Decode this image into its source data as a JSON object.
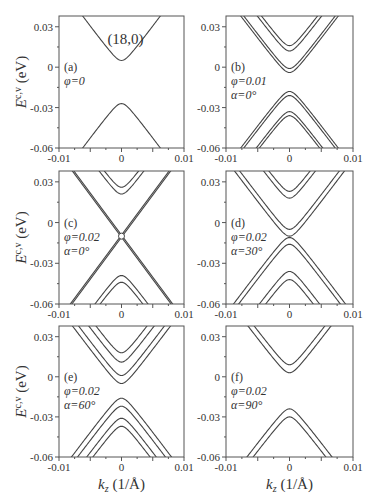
{
  "chart_data": {
    "type": "line",
    "title": "(18,0)",
    "ylabel": "E^{c,v} (eV)",
    "xlabel": "k_z (1/Å)",
    "xlim": [
      -0.01,
      0.01
    ],
    "ylim": [
      -0.06,
      0.038
    ],
    "xticks": [
      "-0.01",
      "0",
      "0.01"
    ],
    "yticks": [
      "0.03",
      "0",
      "-0.03",
      "-0.06"
    ],
    "panels": [
      {
        "id": "a",
        "label": "(a)",
        "phi": "φ=0",
        "alpha": "",
        "title": "(18,0)",
        "conduction_minima": [
          0.005
        ],
        "valence_maxima": [
          -0.027
        ]
      },
      {
        "id": "b",
        "label": "(b)",
        "phi": "φ=0.01",
        "alpha": "α=0°",
        "conduction_minima": [
          0.016,
          0.012,
          -0.001,
          -0.004
        ],
        "valence_maxima": [
          -0.018,
          -0.021,
          -0.033,
          -0.036
        ]
      },
      {
        "id": "c",
        "label": "(c)",
        "phi": "φ=0.02",
        "alpha": "α=0°",
        "conduction_minima": [
          0.026,
          0.021,
          -0.01,
          -0.01
        ],
        "valence_maxima": [
          -0.01,
          -0.01,
          -0.039,
          -0.044
        ]
      },
      {
        "id": "d",
        "label": "(d)",
        "phi": "φ=0.02",
        "alpha": "α=30°",
        "conduction_minima": [
          0.023,
          0.018,
          -0.005,
          -0.01
        ],
        "valence_maxima": [
          -0.011,
          -0.016,
          -0.036,
          -0.042
        ]
      },
      {
        "id": "e",
        "label": "(e)",
        "phi": "φ=0.02",
        "alpha": "α=60°",
        "conduction_minima": [
          0.018,
          0.011,
          0.001,
          -0.005
        ],
        "valence_maxima": [
          -0.016,
          -0.022,
          -0.031,
          -0.037
        ]
      },
      {
        "id": "f",
        "label": "(f)",
        "phi": "φ=0.02",
        "alpha": "α=90°",
        "conduction_minima": [
          0.009,
          0.003
        ],
        "valence_maxima": [
          -0.024,
          -0.03
        ]
      }
    ]
  }
}
